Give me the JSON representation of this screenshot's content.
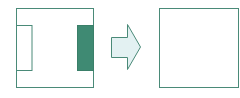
{
  "diagram": {
    "colors": {
      "stroke": "#4a8a78",
      "fill_dark": "#3f8a73",
      "arrow_fill": "#e3f1f2",
      "background": "#ffffff"
    },
    "before_frame": {
      "x": 16,
      "y": 8,
      "w": 78,
      "h": 80
    },
    "left_panel": {
      "x": 16,
      "y": 25,
      "w": 16,
      "h": 45
    },
    "right_filled_panel": {
      "x": 77,
      "y": 25,
      "w": 17,
      "h": 45
    },
    "arrow": {
      "direction": "right"
    },
    "after_frame": {
      "x": 159,
      "y": 8,
      "w": 80,
      "h": 80
    }
  }
}
